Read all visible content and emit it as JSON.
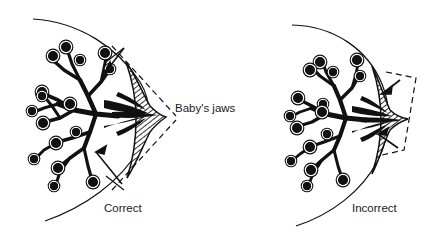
{
  "figure": {
    "background_color": "#ffffff",
    "ink_color": "#111111",
    "panels": [
      {
        "id": "correct",
        "caption": "Correct",
        "caption_x": 104,
        "caption_y": 212,
        "description": "Baby's jaws close beyond the areola, drawing the nipple and lactiferous sinuses deep into the mouth",
        "jaw_indicator": "wide-dashed-wedge",
        "arrow_count": 2,
        "alveoli_count": 16
      },
      {
        "id": "incorrect",
        "caption": "Incorrect",
        "caption_x": 352,
        "caption_y": 212,
        "description": "Baby's jaws close on the nipple only, compressing the nipple tip",
        "jaw_indicator": "narrow-dashed-bracket",
        "arrow_count": 2,
        "alveoli_count": 16
      }
    ],
    "callouts": [
      {
        "id": "babys-jaws",
        "text": "Baby's jaws",
        "x": 175,
        "y": 112
      }
    ],
    "legend_parts": [
      "alveoli",
      "lactiferous-ducts",
      "lactiferous-sinuses",
      "nipple-and-areola",
      "breast-outline",
      "jaw-position-marker"
    ]
  }
}
